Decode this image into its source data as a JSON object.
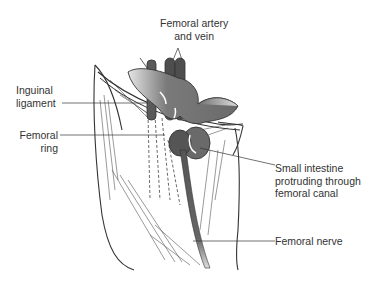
{
  "labels": {
    "femoral_artery_vein": [
      "Femoral artery",
      "and vein"
    ],
    "inguinal_ligament": [
      "Inguinal",
      "ligament"
    ],
    "femoral_ring": [
      "Femoral",
      "ring"
    ],
    "small_intestine": [
      "Small intestine",
      "protruding through",
      "femoral canal"
    ],
    "femoral_nerve": "Femoral nerve"
  },
  "colors": {
    "organ_gray": "#6e6e6e",
    "vessel_dark": "#4a4a4a",
    "line": "#333333"
  }
}
